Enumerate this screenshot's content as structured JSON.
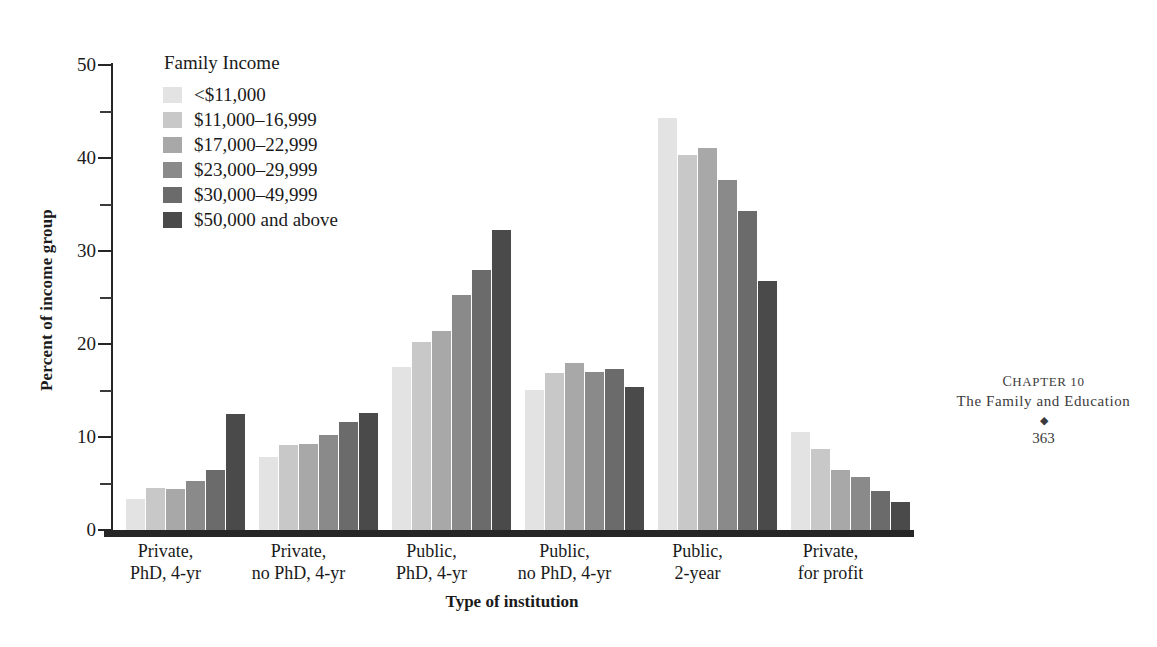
{
  "chart_data": {
    "type": "bar",
    "title": "",
    "xlabel": "Type of institution",
    "ylabel": "Percent of income group",
    "ylim": [
      0,
      50
    ],
    "ytick_labels": [
      "0",
      "10",
      "20",
      "30",
      "40",
      "50"
    ],
    "ytick_values": [
      0,
      10,
      20,
      30,
      40,
      50
    ],
    "yminor_values": [
      5,
      15,
      25,
      35,
      45
    ],
    "grid": false,
    "legend_position": "upper-left-inside",
    "legend_title": "Family Income",
    "categories": [
      "Private, PhD, 4-yr",
      "Private, no PhD, 4-yr",
      "Public, PhD, 4-yr",
      "Public, no PhD, 4-yr",
      "Public, 2-year",
      "Private, for profit"
    ],
    "category_lines": [
      [
        "Private,",
        "PhD, 4-yr"
      ],
      [
        "Private,",
        "no PhD, 4-yr"
      ],
      [
        "Public,",
        "PhD, 4-yr"
      ],
      [
        "Public,",
        "no PhD, 4-yr"
      ],
      [
        "Public,",
        "2-year"
      ],
      [
        "Private,",
        "for profit"
      ]
    ],
    "series": [
      {
        "name": "<$11,000",
        "color": "#e3e3e3",
        "values": [
          3.3,
          7.9,
          17.5,
          15.1,
          44.3,
          10.5
        ]
      },
      {
        "name": "$11,000–16,999",
        "color": "#c8c8c8",
        "values": [
          4.5,
          9.1,
          20.2,
          16.9,
          40.3,
          8.7
        ]
      },
      {
        "name": "$17,000–22,999",
        "color": "#a8a8a8",
        "values": [
          4.4,
          9.2,
          21.4,
          18.0,
          41.1,
          6.5
        ]
      },
      {
        "name": "$23,000–29,999",
        "color": "#8a8a8a",
        "values": [
          5.3,
          10.2,
          25.3,
          17.0,
          37.6,
          5.7
        ]
      },
      {
        "name": "$30,000–49,999",
        "color": "#6b6b6b",
        "values": [
          6.5,
          11.6,
          28.0,
          17.3,
          34.3,
          4.2
        ]
      },
      {
        "name": "$50,000 and above",
        "color": "#4a4a4a",
        "values": [
          12.5,
          12.6,
          32.3,
          15.4,
          26.8,
          3.0
        ]
      }
    ]
  },
  "page_footer": {
    "chapter": "Chapter 10",
    "title": "The Family and Education",
    "ornament": "◆",
    "page_number": "363"
  }
}
